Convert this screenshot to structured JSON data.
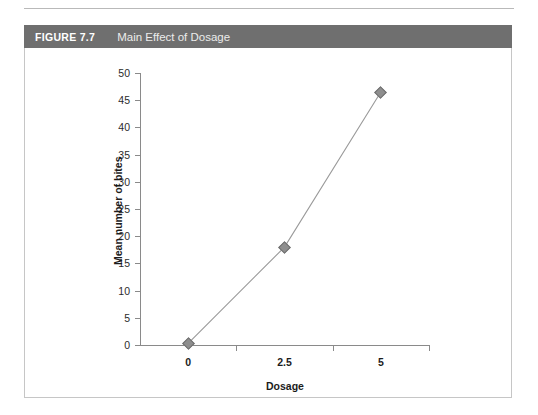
{
  "figure": {
    "number": "FIGURE 7.7",
    "caption": "Main Effect of Dosage"
  },
  "colors": {
    "header_bar": "#6f6f6f",
    "header_number_text": "#ffffff",
    "header_caption_text": "#ececeb",
    "figure_border": "#c6c6c6",
    "axis": "#8a8a8a",
    "line": "#9a9a9a",
    "marker_fill": "#8e8e8e",
    "marker_stroke": "#6e6e6e",
    "background": "#ffffff"
  },
  "chart_data": {
    "type": "line",
    "title": "Main Effect of Dosage",
    "xlabel": "Dosage",
    "ylabel": "Mean number of bites",
    "categories": [
      "0",
      "2.5",
      "5"
    ],
    "x": [
      0,
      2.5,
      5
    ],
    "values": [
      0.3,
      18,
      46.5
    ],
    "series": [
      {
        "name": "Mean number of bites",
        "values": [
          0.3,
          18,
          46.5
        ]
      }
    ],
    "ylim": [
      0,
      50
    ],
    "yticks": [
      0,
      5,
      10,
      15,
      20,
      25,
      30,
      35,
      40,
      45,
      50
    ],
    "ytick_labels": [
      "0",
      "5",
      "10",
      "15",
      "20",
      "25",
      "30",
      "35",
      "40",
      "45",
      "50"
    ],
    "xtick_labels": [
      "0",
      "2.5",
      "5"
    ],
    "grid": false,
    "legend": false,
    "marker": "diamond"
  }
}
